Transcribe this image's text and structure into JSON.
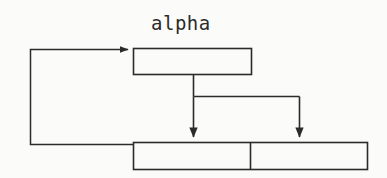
{
  "canvas": {
    "width": 387,
    "height": 178,
    "background_color": "#fbfbfa",
    "line_color": "#2b2b2b",
    "text_color": "#2b2b2b"
  },
  "diagram": {
    "type": "block-flow-diagram",
    "title_label": "alpha",
    "nodes": [
      {
        "id": "alpha-box",
        "label": "alpha",
        "label_position": "above",
        "text": "",
        "x": 133,
        "y": 48,
        "width": 119,
        "height": 27
      },
      {
        "id": "bottom-box-left-cell",
        "label": "",
        "text": "",
        "x": 133,
        "y": 142,
        "width": 117,
        "height": 28
      },
      {
        "id": "bottom-box-right-cell",
        "label": "",
        "text": "",
        "x": 250,
        "y": 142,
        "width": 118,
        "height": 28
      }
    ],
    "connectors": [
      {
        "id": "feedback-loop",
        "from": "bottom-box-left-cell",
        "to": "alpha-box",
        "arrowhead": "right",
        "style": "orthogonal"
      },
      {
        "id": "branch-stem",
        "from": "alpha-box",
        "to": "branch-bar",
        "arrowhead": "none",
        "style": "vertical"
      },
      {
        "id": "branch-arrow-left",
        "from": "branch-bar",
        "to": "bottom-box-left-cell",
        "arrowhead": "down",
        "style": "vertical"
      },
      {
        "id": "branch-arrow-right",
        "from": "branch-bar",
        "to": "bottom-box-right-cell",
        "arrowhead": "down",
        "style": "vertical"
      }
    ]
  }
}
